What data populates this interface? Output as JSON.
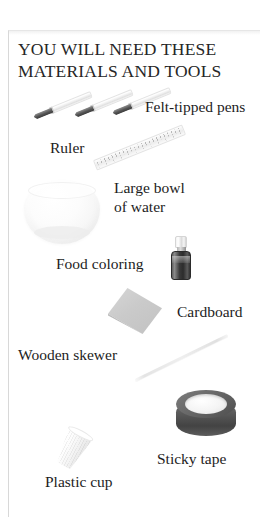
{
  "page": {
    "background_color": "#ffffff",
    "frame_color": "#d8d8d8"
  },
  "heading": {
    "text": "YOU WILL NEED THESE\nMATERIALS AND TOOLS",
    "color": "#262626"
  },
  "materials": [
    {
      "id": "felt-tipped-pens",
      "label": "Felt-tipped pens",
      "illustration": "three-slanted-marker-pens",
      "color": "#4a4a4a"
    },
    {
      "id": "ruler",
      "label": "Ruler",
      "illustration": "transparent-slanted-ruler",
      "color": "#ececec"
    },
    {
      "id": "large-bowl-of-water",
      "label": "Large bowl\nof water",
      "illustration": "pale-glass-bowl",
      "color": "#f4f4f4"
    },
    {
      "id": "food-coloring",
      "label": "Food coloring",
      "illustration": "small-dark-bottle",
      "color": "#333333"
    },
    {
      "id": "cardboard",
      "label": "Cardboard",
      "illustration": "grey-square-sheet",
      "color": "#cacaca"
    },
    {
      "id": "wooden-skewer",
      "label": "Wooden skewer",
      "illustration": "thin-diagonal-stick",
      "color": "#e4e4e4"
    },
    {
      "id": "sticky-tape",
      "label": "Sticky tape",
      "illustration": "dark-tape-roll",
      "color": "#545454"
    },
    {
      "id": "plastic-cup",
      "label": "Plastic cup",
      "illustration": "white-ribbed-tumbler",
      "color": "#f5f5f5"
    }
  ]
}
